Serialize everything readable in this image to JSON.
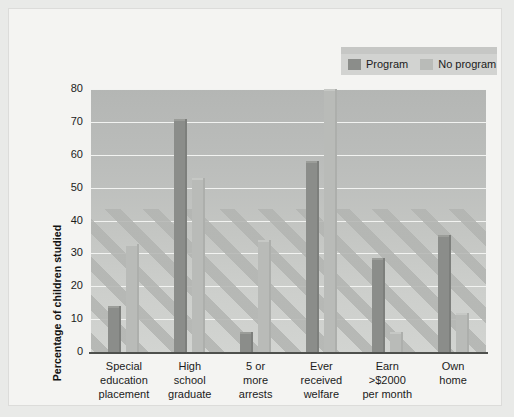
{
  "chart_data": {
    "type": "bar",
    "title": "",
    "xlabel": "",
    "ylabel": "Percentage of children studied",
    "ylim": [
      0,
      80
    ],
    "ytick_step": 10,
    "yticks": [
      "80",
      "70",
      "60",
      "50",
      "40",
      "30",
      "20",
      "10",
      "0"
    ],
    "grid": true,
    "legend_position": "top-right",
    "categories": [
      "Special\neducation\nplacement",
      "High\nschool\ngraduate",
      "5 or\nmore\narrests",
      "Ever\nreceived\nwelfare",
      "Earn\n>$2000\nper month",
      "Own\nhome"
    ],
    "category_lines": [
      [
        "Special",
        "education",
        "placement"
      ],
      [
        "High",
        "school",
        "graduate"
      ],
      [
        "5 or",
        "more",
        "arrests"
      ],
      [
        "Ever",
        "received",
        "welfare"
      ],
      [
        "Earn",
        ">$2000",
        "per month"
      ],
      [
        "Own",
        "home"
      ]
    ],
    "series": [
      {
        "name": "Program",
        "color": "#8b8d8a",
        "values": [
          14,
          71,
          6,
          58,
          28.5,
          35.5
        ]
      },
      {
        "name": "No program",
        "color": "#b9bbb8",
        "values": [
          33,
          53,
          34,
          80,
          6,
          12
        ]
      }
    ]
  },
  "legend": {
    "items": [
      {
        "label": "Program",
        "swatch": "#8b8d8a"
      },
      {
        "label": "No program",
        "swatch": "#b9bbb8"
      }
    ]
  },
  "colors": {
    "program": "#8b8d8a",
    "no_program": "#b9bbb8",
    "plot_background": "#c2c4c1",
    "gridline": "#f2f3f1",
    "axis": "#4e504d",
    "page_background": "#f4f4f2",
    "text": "#1b1b1b"
  }
}
